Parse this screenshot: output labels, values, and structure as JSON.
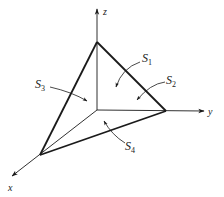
{
  "diagram": {
    "type": "tetrahedron-surfaces",
    "axes": {
      "x": {
        "label": "x"
      },
      "y": {
        "label": "y"
      },
      "z": {
        "label": "z"
      }
    },
    "surfaces": [
      {
        "id": "S1",
        "letter": "S",
        "sub": "1"
      },
      {
        "id": "S2",
        "letter": "S",
        "sub": "2"
      },
      {
        "id": "S3",
        "letter": "S",
        "sub": "3"
      },
      {
        "id": "S4",
        "letter": "S",
        "sub": "4"
      }
    ],
    "colors": {
      "line": "#1a1a1a",
      "background": "#ffffff"
    }
  }
}
